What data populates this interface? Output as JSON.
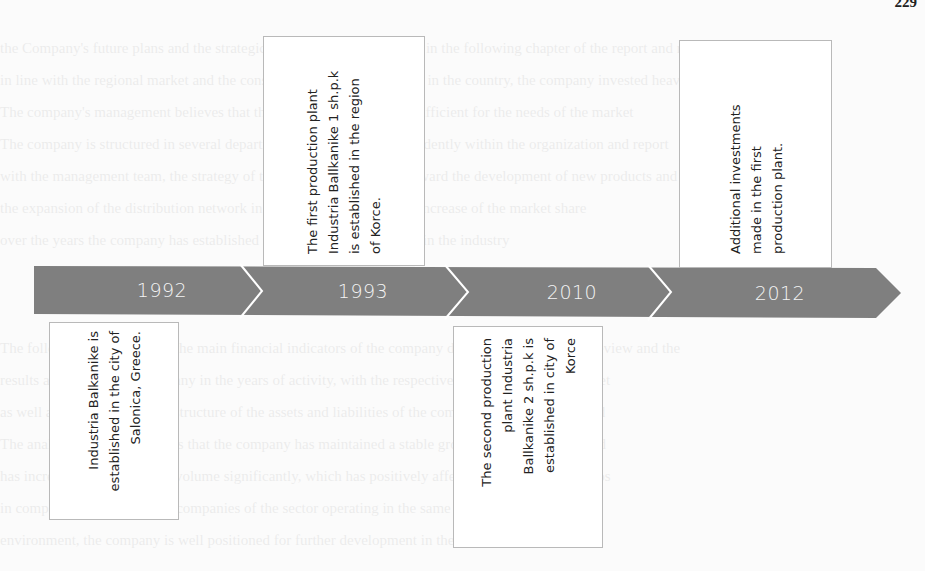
{
  "page": {
    "number": "229"
  },
  "timeline": {
    "bar_color": "#7f7f7f",
    "divider_color": "#ffffff",
    "segments": [
      {
        "year": "1992"
      },
      {
        "year": "1993"
      },
      {
        "year": "2010"
      },
      {
        "year": "2012"
      }
    ]
  },
  "events": [
    {
      "year": "1992",
      "position": "below",
      "text": "Industria Balkanike is\nestablished in the city of\nSalonica, Greece."
    },
    {
      "year": "1993",
      "position": "above",
      "text": "The first production plant\nIndustria Ballkanike 1 sh.p.k\nis established in the region\nof Korce."
    },
    {
      "year": "2010",
      "position": "below",
      "text": "The second production\nplant Industria\nBallkanike 2 sh.p.k is\nestablished in city of\nKorce"
    },
    {
      "year": "2012",
      "position": "above",
      "text": "Additional investments\nmade in the first\nproduction plant."
    }
  ]
}
